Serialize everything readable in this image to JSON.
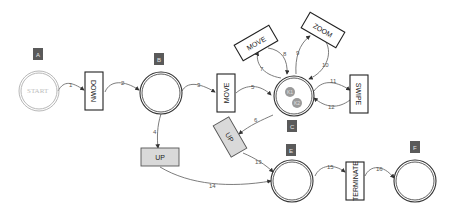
{
  "diagram": {
    "type": "state-machine",
    "states": [
      {
        "id": "A",
        "badge": "A",
        "label": "START",
        "style": "light-double-ring"
      },
      {
        "id": "B",
        "badge": "B",
        "label": "",
        "style": "double-ring"
      },
      {
        "id": "C",
        "badge": "C",
        "label": "",
        "style": "double-ring-light",
        "tokens": [
          "K1",
          "K2"
        ]
      },
      {
        "id": "E",
        "badge": "E",
        "label": "",
        "style": "double-ring"
      },
      {
        "id": "F",
        "badge": "F",
        "label": "",
        "style": "light-double-ring"
      }
    ],
    "transitions": [
      {
        "id": "down",
        "label": "DOWN",
        "style": "white"
      },
      {
        "id": "move1",
        "label": "MOVE",
        "style": "white"
      },
      {
        "id": "up1",
        "label": "UP",
        "style": "grey"
      },
      {
        "id": "move2",
        "label": "MOVE",
        "style": "white"
      },
      {
        "id": "zoom",
        "label": "ZOOM",
        "style": "white"
      },
      {
        "id": "swipe",
        "label": "SWIPE",
        "style": "white"
      },
      {
        "id": "up2",
        "label": "UP",
        "style": "grey"
      },
      {
        "id": "terminate",
        "label": "TERMINATE",
        "style": "white"
      }
    ],
    "arcs": [
      {
        "n": "1",
        "from": "A",
        "to": "DOWN"
      },
      {
        "n": "2",
        "from": "DOWN",
        "to": "B"
      },
      {
        "n": "3",
        "from": "B",
        "to": "MOVE"
      },
      {
        "n": "4",
        "from": "B",
        "to": "UP"
      },
      {
        "n": "5",
        "from": "MOVE",
        "to": "C"
      },
      {
        "n": "6",
        "from": "C",
        "to": "UP"
      },
      {
        "n": "7",
        "from": "C",
        "to": "MOVE"
      },
      {
        "n": "8",
        "from": "MOVE",
        "to": "C"
      },
      {
        "n": "9",
        "from": "C",
        "to": "ZOOM"
      },
      {
        "n": "10",
        "from": "ZOOM",
        "to": "C"
      },
      {
        "n": "11",
        "from": "C",
        "to": "SWIPE"
      },
      {
        "n": "12",
        "from": "SWIPE",
        "to": "C"
      },
      {
        "n": "13",
        "from": "UP",
        "to": "E"
      },
      {
        "n": "14",
        "from": "UP",
        "to": "E"
      },
      {
        "n": "15",
        "from": "E",
        "to": "TERMINATE"
      },
      {
        "n": "16",
        "from": "TERMINATE",
        "to": "F"
      }
    ]
  }
}
